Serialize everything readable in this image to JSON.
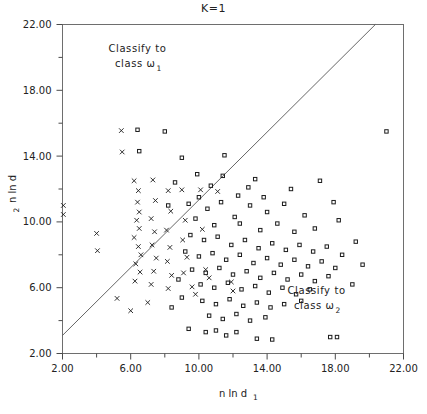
{
  "chart_data": {
    "type": "scatter",
    "title": "K=1",
    "xlabel": "n ln d",
    "xlabel_sub": "1",
    "ylabel": "n ln d",
    "ylabel_sub": "2",
    "xlim": [
      2.0,
      22.0
    ],
    "ylim": [
      2.0,
      22.0
    ],
    "xticks": [
      2.0,
      6.0,
      10.0,
      14.0,
      18.0,
      22.0
    ],
    "xtick_labels": [
      "2.00",
      "6.00",
      "10.00",
      "14.00",
      "18.00",
      "22.00"
    ],
    "yticks": [
      2.0,
      6.0,
      10.0,
      14.0,
      18.0,
      22.0
    ],
    "ytick_labels": [
      "2.00",
      "6.00",
      "10.00",
      "14.00",
      "18.00",
      "22.00"
    ],
    "minor_tick_step": 2.0,
    "grid": false,
    "legend": "none",
    "annotations": [
      {
        "name": "classify-class-1",
        "line1": "Classify to",
        "line2": "class ",
        "symbol": "ω",
        "subscript": "1",
        "x": 6.4,
        "y": 20.3
      },
      {
        "name": "classify-class-2",
        "line1": "Classify to",
        "line2": "class ",
        "symbol": "ω",
        "subscript": "2",
        "x": 16.9,
        "y": 5.6
      }
    ],
    "decision_boundary": {
      "name": "decision-boundary",
      "description": "straight discriminant line",
      "x0": 2.0,
      "y0": 3.1,
      "x1": 20.35,
      "y1": 22.0
    },
    "series": [
      {
        "name": "class-omega-1",
        "marker": "cross",
        "points": [
          [
            2.05,
            11.0
          ],
          [
            2.05,
            10.45
          ],
          [
            4.0,
            9.3
          ],
          [
            4.05,
            8.25
          ],
          [
            5.45,
            15.55
          ],
          [
            5.5,
            14.25
          ],
          [
            6.2,
            12.5
          ],
          [
            6.45,
            11.9
          ],
          [
            6.4,
            11.2
          ],
          [
            6.5,
            10.6
          ],
          [
            6.35,
            10.1
          ],
          [
            6.5,
            9.6
          ],
          [
            6.2,
            9.05
          ],
          [
            6.45,
            8.5
          ],
          [
            6.6,
            8.0
          ],
          [
            6.3,
            7.45
          ],
          [
            6.55,
            6.95
          ],
          [
            6.25,
            6.4
          ],
          [
            7.3,
            12.55
          ],
          [
            7.45,
            11.3
          ],
          [
            7.2,
            10.2
          ],
          [
            7.4,
            9.4
          ],
          [
            7.25,
            8.6
          ],
          [
            7.5,
            7.8
          ],
          [
            7.35,
            7.0
          ],
          [
            7.2,
            6.2
          ],
          [
            8.2,
            11.9
          ],
          [
            8.35,
            10.65
          ],
          [
            8.1,
            9.5
          ],
          [
            8.3,
            8.45
          ],
          [
            8.15,
            7.6
          ],
          [
            8.4,
            6.75
          ],
          [
            8.2,
            5.95
          ],
          [
            9.0,
            11.95
          ],
          [
            9.2,
            10.1
          ],
          [
            9.05,
            8.9
          ],
          [
            9.3,
            7.85
          ],
          [
            9.1,
            6.9
          ],
          [
            10.1,
            11.95
          ],
          [
            10.2,
            9.55
          ],
          [
            11.1,
            11.85
          ],
          [
            5.2,
            5.35
          ],
          [
            6.0,
            4.6
          ],
          [
            7.0,
            5.1
          ],
          [
            9.6,
            6.05
          ],
          [
            9.8,
            5.6
          ],
          [
            11.9,
            6.35
          ],
          [
            12.0,
            5.8
          ],
          [
            10.4,
            7.1
          ],
          [
            10.6,
            6.6
          ]
        ]
      },
      {
        "name": "class-omega-2",
        "marker": "square",
        "points": [
          [
            6.4,
            15.6
          ],
          [
            8.0,
            15.5
          ],
          [
            6.5,
            14.3
          ],
          [
            9.0,
            13.9
          ],
          [
            11.5,
            14.05
          ],
          [
            21.0,
            15.5
          ],
          [
            13.3,
            12.6
          ],
          [
            17.1,
            12.5
          ],
          [
            8.2,
            11.0
          ],
          [
            9.4,
            11.1
          ],
          [
            10.5,
            10.8
          ],
          [
            11.3,
            11.2
          ],
          [
            12.1,
            10.3
          ],
          [
            13.0,
            11.0
          ],
          [
            14.0,
            10.6
          ],
          [
            15.0,
            11.1
          ],
          [
            16.2,
            10.4
          ],
          [
            9.8,
            10.2
          ],
          [
            10.9,
            9.8
          ],
          [
            12.4,
            9.9
          ],
          [
            13.6,
            9.5
          ],
          [
            14.6,
            9.9
          ],
          [
            15.6,
            9.4
          ],
          [
            16.8,
            9.6
          ],
          [
            18.2,
            10.1
          ],
          [
            9.5,
            9.2
          ],
          [
            10.3,
            8.9
          ],
          [
            11.1,
            9.1
          ],
          [
            11.9,
            8.6
          ],
          [
            12.7,
            8.9
          ],
          [
            13.5,
            8.4
          ],
          [
            14.3,
            8.7
          ],
          [
            15.1,
            8.3
          ],
          [
            15.9,
            8.6
          ],
          [
            16.7,
            8.2
          ],
          [
            17.5,
            8.5
          ],
          [
            18.4,
            8.0
          ],
          [
            9.2,
            8.2
          ],
          [
            10.0,
            7.9
          ],
          [
            10.8,
            8.1
          ],
          [
            11.6,
            7.7
          ],
          [
            12.4,
            8.0
          ],
          [
            13.2,
            7.5
          ],
          [
            14.0,
            7.8
          ],
          [
            14.8,
            7.4
          ],
          [
            15.6,
            7.7
          ],
          [
            16.4,
            7.3
          ],
          [
            17.2,
            7.6
          ],
          [
            18.0,
            7.2
          ],
          [
            9.6,
            7.1
          ],
          [
            10.4,
            6.9
          ],
          [
            11.2,
            7.2
          ],
          [
            12.0,
            6.8
          ],
          [
            12.8,
            7.0
          ],
          [
            13.6,
            6.6
          ],
          [
            14.4,
            6.9
          ],
          [
            15.2,
            6.5
          ],
          [
            16.0,
            6.8
          ],
          [
            16.8,
            6.4
          ],
          [
            17.6,
            6.7
          ],
          [
            10.1,
            6.2
          ],
          [
            10.9,
            6.0
          ],
          [
            11.7,
            6.3
          ],
          [
            12.5,
            5.9
          ],
          [
            13.3,
            6.1
          ],
          [
            14.1,
            5.7
          ],
          [
            14.9,
            6.0
          ],
          [
            15.7,
            5.6
          ],
          [
            16.5,
            5.9
          ],
          [
            19.0,
            6.2
          ],
          [
            10.2,
            5.2
          ],
          [
            11.0,
            5.0
          ],
          [
            11.8,
            5.3
          ],
          [
            12.6,
            4.9
          ],
          [
            13.4,
            5.1
          ],
          [
            14.2,
            4.8
          ],
          [
            15.0,
            5.0
          ],
          [
            16.0,
            5.2
          ],
          [
            10.6,
            4.3
          ],
          [
            11.4,
            4.1
          ],
          [
            12.2,
            4.4
          ],
          [
            13.0,
            4.0
          ],
          [
            13.9,
            4.2
          ],
          [
            9.4,
            3.5
          ],
          [
            10.4,
            3.3
          ],
          [
            11.0,
            3.4
          ],
          [
            11.6,
            3.1
          ],
          [
            12.2,
            3.3
          ],
          [
            13.4,
            2.9
          ],
          [
            14.3,
            2.85
          ],
          [
            17.7,
            3.0
          ],
          [
            18.1,
            3.0
          ],
          [
            12.9,
            12.1
          ],
          [
            10.7,
            12.2
          ],
          [
            8.6,
            12.4
          ],
          [
            11.4,
            12.8
          ],
          [
            9.9,
            12.9
          ],
          [
            19.6,
            7.4
          ],
          [
            19.2,
            8.8
          ],
          [
            8.8,
            6.5
          ],
          [
            9.0,
            5.4
          ],
          [
            8.4,
            4.8
          ],
          [
            12.3,
            11.6
          ],
          [
            13.8,
            11.5
          ],
          [
            15.4,
            12.0
          ],
          [
            10.0,
            11.5
          ],
          [
            17.9,
            11.2
          ]
        ]
      }
    ]
  }
}
